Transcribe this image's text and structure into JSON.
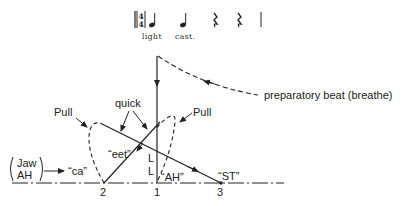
{
  "notation": {
    "time_signature": {
      "top": "4",
      "bottom": "4"
    },
    "lyrics": [
      "light",
      "cast."
    ],
    "symbols": [
      "quarter-note",
      "quarter-note",
      "quarter-rest",
      "quarter-rest",
      "barline"
    ]
  },
  "labels": {
    "preparatory": "preparatory beat (breathe)",
    "pull_left": "Pull",
    "pull_right": "Pull",
    "quick": "quick",
    "jaw_top": "Jaw",
    "jaw_bottom": "AH",
    "ca": "“ca”",
    "eet": "“eet”",
    "ah": "“AH”",
    "st": "“ST”",
    "l1": "L",
    "l2": "L"
  },
  "beats": {
    "b2": "2",
    "b1": "1",
    "b3": "3"
  },
  "colors": {
    "ink": "#222222",
    "background": "#ffffff"
  }
}
